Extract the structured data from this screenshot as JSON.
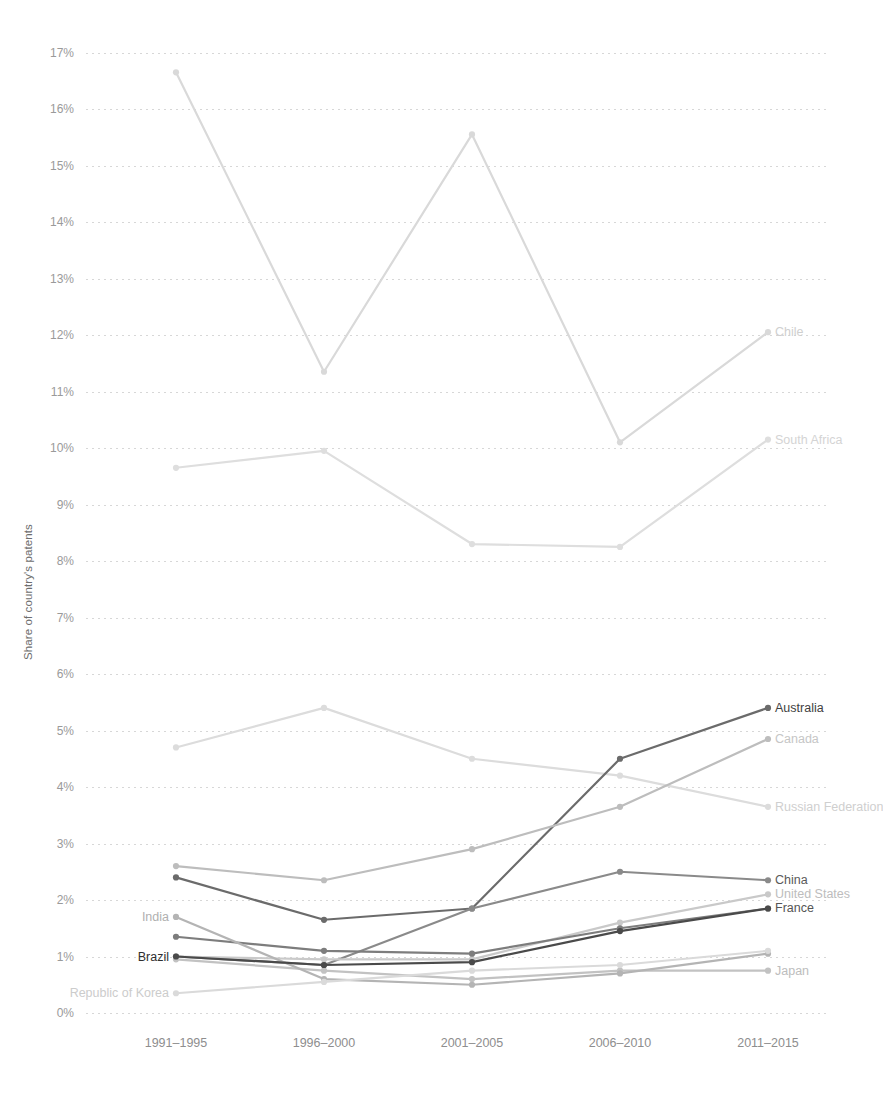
{
  "chart_data": {
    "type": "line",
    "title": "",
    "subtitle": "",
    "xlabel": "",
    "ylabel": "Share of country's patents",
    "categories": [
      "1991–1995",
      "1996–2000",
      "2001–2005",
      "2006–2010",
      "2011–2015"
    ],
    "ylim": [
      0,
      17.4
    ],
    "ytick_labels": [
      "0%",
      "1%",
      "2%",
      "3%",
      "4%",
      "5%",
      "6%",
      "7%",
      "8%",
      "9%",
      "10%",
      "11%",
      "12%",
      "13%",
      "14%",
      "15%",
      "16%",
      "17%"
    ],
    "ytick_values": [
      0,
      1,
      2,
      3,
      4,
      5,
      6,
      7,
      8,
      9,
      10,
      11,
      12,
      13,
      14,
      15,
      16,
      17
    ],
    "grid": true,
    "legend_position": "right-inline-labels",
    "value_unit": "percent",
    "series": [
      {
        "name": "Chile",
        "color": "#d9d9d9",
        "label_color": "#cfcfcf",
        "label_side": "right",
        "values": [
          16.65,
          11.35,
          15.55,
          10.1,
          12.05
        ]
      },
      {
        "name": "South Africa",
        "color": "#dedede",
        "label_color": "#d4d4d4",
        "label_side": "right",
        "values": [
          9.65,
          9.95,
          8.3,
          8.25,
          10.15
        ]
      },
      {
        "name": "Russian Federation",
        "color": "#dcdcdc",
        "label_color": "#cfcfcf",
        "label_side": "right",
        "values": [
          4.7,
          5.4,
          4.5,
          4.2,
          3.65
        ]
      },
      {
        "name": "Australia",
        "color": "#6b6b6b",
        "label_color": "#3f3f3f",
        "label_side": "right",
        "values": [
          2.4,
          1.65,
          1.85,
          4.5,
          5.4
        ]
      },
      {
        "name": "Canada",
        "color": "#bdbdbd",
        "label_color": "#c6c6c6",
        "label_side": "right",
        "values": [
          2.6,
          2.35,
          2.9,
          3.65,
          4.85
        ]
      },
      {
        "name": "China",
        "color": "#8a8a8a",
        "label_color": "#5a5a5a",
        "label_side": "right",
        "values": [
          1.0,
          0.85,
          1.85,
          2.5,
          2.35
        ]
      },
      {
        "name": "United States",
        "color": "#c9c9c9",
        "label_color": "#bdbdbd",
        "label_side": "right",
        "values": [
          1.0,
          0.95,
          0.95,
          1.6,
          2.1
        ]
      },
      {
        "name": "France",
        "color": "#7d7d7d",
        "label_color": "#555555",
        "label_side": "right",
        "values": [
          1.35,
          1.1,
          1.05,
          1.5,
          1.85
        ]
      },
      {
        "name": "Japan",
        "color": "#c2c2c2",
        "label_color": "#bdbdbd",
        "label_side": "right",
        "values": [
          0.95,
          0.75,
          0.6,
          0.75,
          0.75
        ]
      },
      {
        "name": "India",
        "color": "#b4b4b4",
        "label_color": "#b0b0b0",
        "label_side": "left",
        "values": [
          1.7,
          0.6,
          0.5,
          0.7,
          1.05
        ]
      },
      {
        "name": "Brazil",
        "color": "#4a4a4a",
        "label_color": "#2f2f2f",
        "label_side": "left",
        "values": [
          1.0,
          0.85,
          0.9,
          1.45,
          1.85
        ]
      },
      {
        "name": "Republic of Korea",
        "color": "#dadada",
        "label_color": "#cccccc",
        "label_side": "left",
        "values": [
          0.35,
          0.55,
          0.75,
          0.85,
          1.1
        ]
      }
    ]
  },
  "axis": {
    "y_title": "Share of country's patents"
  }
}
